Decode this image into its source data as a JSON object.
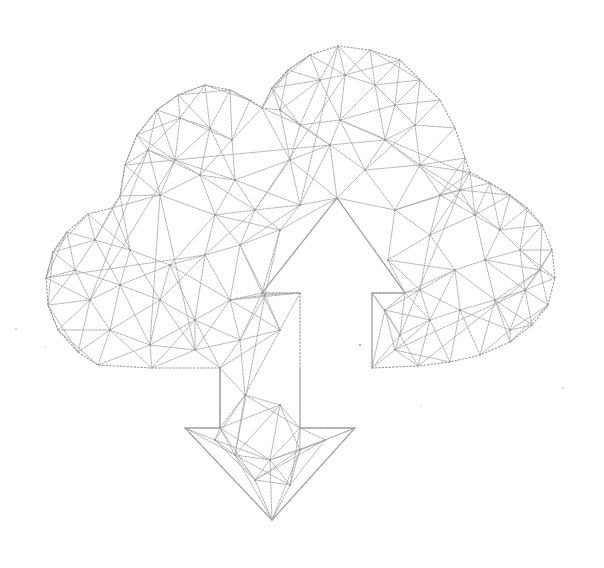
{
  "illustration": {
    "subject": "low-poly wireframe cloud with upload and download arrows",
    "background_color": "#ffffff",
    "line_color": "#a8a8a8",
    "line_style": "dashed",
    "icons": [
      "cloud-icon",
      "upload-arrow-icon",
      "download-arrow-icon"
    ]
  }
}
